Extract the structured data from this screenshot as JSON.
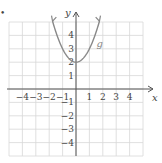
{
  "chart_data": {
    "type": "line",
    "title": "",
    "xlabel": "x",
    "ylabel": "y",
    "xlim": [
      -5,
      5
    ],
    "ylim": [
      -5,
      5
    ],
    "grid": true,
    "x_ticks": [
      -4,
      -3,
      -2,
      -1,
      1,
      2,
      3,
      4
    ],
    "y_ticks": [
      -4,
      -3,
      -2,
      -1,
      1,
      2,
      3,
      4
    ],
    "x_tick_labels": [
      "−4",
      "−3",
      "−2",
      "−1",
      "1",
      "2",
      "3",
      "4"
    ],
    "y_tick_labels": [
      "−4",
      "−3",
      "−2",
      "−1",
      "1",
      "2",
      "3",
      "4"
    ],
    "series": [
      {
        "name": "g",
        "equation": "g(x) = x^2 + 2",
        "color": "#888888",
        "x": [
          -1.75,
          -1.5,
          -1,
          -0.5,
          0,
          0.5,
          1,
          1.5,
          1.75
        ],
        "y": [
          5.06,
          4.25,
          3,
          2.25,
          2,
          2.25,
          3,
          4.25,
          5.06
        ],
        "arrows_both_ends": true
      }
    ],
    "annotations": [
      {
        "text": "g",
        "x": 1.3,
        "y": 3.4
      }
    ]
  },
  "labels": {
    "x_axis": "x",
    "y_axis": "y",
    "curve": "g",
    "bullet": "•"
  },
  "colors": {
    "grid": "#d8d8d8",
    "axis": "#555555",
    "curve": "#8a8a8a",
    "text": "#444444"
  }
}
